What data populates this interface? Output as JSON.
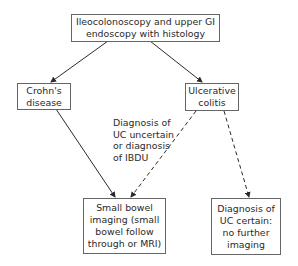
{
  "diagram": {
    "nodes": {
      "start": {
        "lines": [
          "Ileocolonoscopy and upper GI",
          "endoscopy with histology"
        ]
      },
      "crohns": {
        "lines": [
          "Crohn's",
          "disease"
        ]
      },
      "uc": {
        "lines": [
          "Ulcerative",
          "colitis"
        ]
      },
      "small_bowel": {
        "lines": [
          "Small bowel",
          "imaging (small",
          "bowel follow",
          "through or MRI)"
        ]
      },
      "uc_certain": {
        "lines": [
          "Diagnosis of",
          "UC certain:",
          "no further",
          "imaging"
        ]
      }
    },
    "edge_label": {
      "lines": [
        "Diagnosis of",
        "UC uncertain",
        "or diagnosis",
        "of IBDU"
      ]
    },
    "edges": [
      {
        "from": "start",
        "to": "crohns",
        "style": "solid"
      },
      {
        "from": "start",
        "to": "uc",
        "style": "solid"
      },
      {
        "from": "crohns",
        "to": "small_bowel",
        "style": "solid"
      },
      {
        "from": "uc",
        "to": "small_bowel",
        "style": "dashed",
        "label": "edge_label"
      },
      {
        "from": "uc",
        "to": "uc_certain",
        "style": "dashed"
      }
    ],
    "colors": {
      "line": "#2a2a2a",
      "border": "#666666"
    }
  }
}
